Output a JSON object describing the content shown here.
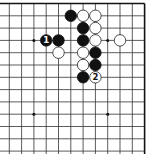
{
  "diagram": {
    "type": "go-board-fragment",
    "corner": "top-right",
    "grid": {
      "origin_x": 9.3,
      "origin_y": 3.5,
      "spacing": 12.3,
      "columns": 12,
      "rows": 13,
      "top_edge": true,
      "right_edge": true,
      "left_edge": false,
      "bottom_edge": false,
      "line_color": "#333333",
      "edge_color": "#111111"
    },
    "star_points": [
      {
        "col": 2,
        "row": 3
      },
      {
        "col": 8,
        "row": 3
      },
      {
        "col": 2,
        "row": 9
      },
      {
        "col": 8,
        "row": 9
      }
    ],
    "stones": [
      {
        "color": "black",
        "col": 5,
        "row": 1,
        "label": ""
      },
      {
        "color": "white",
        "col": 6,
        "row": 1,
        "label": ""
      },
      {
        "color": "white",
        "col": 7,
        "row": 1,
        "label": ""
      },
      {
        "color": "black",
        "col": 6,
        "row": 2,
        "label": ""
      },
      {
        "color": "white",
        "col": 7,
        "row": 2,
        "label": ""
      },
      {
        "color": "black",
        "col": 3,
        "row": 3,
        "label": "1"
      },
      {
        "color": "black",
        "col": 4,
        "row": 3,
        "label": ""
      },
      {
        "color": "black",
        "col": 6,
        "row": 3,
        "label": ""
      },
      {
        "color": "white",
        "col": 7,
        "row": 3,
        "label": ""
      },
      {
        "color": "white",
        "col": 9,
        "row": 3,
        "label": ""
      },
      {
        "color": "white",
        "col": 4,
        "row": 4,
        "label": ""
      },
      {
        "color": "white",
        "col": 6,
        "row": 4,
        "label": ""
      },
      {
        "color": "black",
        "col": 7,
        "row": 4,
        "label": ""
      },
      {
        "color": "white",
        "col": 6,
        "row": 5,
        "label": ""
      },
      {
        "color": "black",
        "col": 7,
        "row": 5,
        "label": ""
      },
      {
        "color": "black",
        "col": 6,
        "row": 6,
        "label": ""
      },
      {
        "color": "white",
        "col": 7,
        "row": 6,
        "label": "2"
      }
    ],
    "colors": {
      "black_stone": "#111111",
      "white_stone": "#ffffff",
      "white_stone_outline": "#222222",
      "black_label": "#ffffff",
      "white_label": "#111111"
    }
  }
}
